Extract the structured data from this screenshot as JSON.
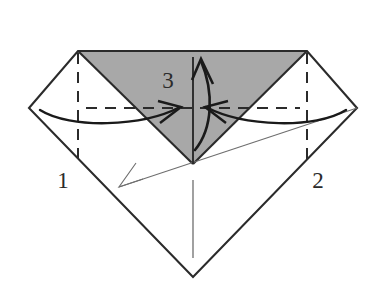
{
  "figure": {
    "kind": "origami-fold-diagram",
    "title": "",
    "background_color": "#ffffff",
    "width": 387,
    "height": 287
  },
  "colors": {
    "paper_front": "#ffffff",
    "paper_back_shaded": "#a8a8a8",
    "outline": "#2b2b2b",
    "fold_line": "#2b2b2b",
    "thin_crease": "#6e6e6e",
    "arrow": "#1a1a1a",
    "label_text": "#2b2b2b"
  },
  "shapes": {
    "kite_outline": {
      "name": "paper-outline",
      "points": "78,51 307,51 357,108 193,277 29,108"
    },
    "shaded_triangle": {
      "name": "shaded-flap",
      "points": "78,51 307,51 193,164",
      "fill": "#a8a8a8"
    }
  },
  "fold_lines": [
    {
      "name": "left-vertical-fold",
      "x1": 78,
      "y1": 53,
      "x2": 78,
      "y2": 166
    },
    {
      "name": "right-vertical-fold",
      "x1": 307,
      "y1": 53,
      "x2": 307,
      "y2": 166
    },
    {
      "name": "horizontal-fold",
      "x1": 86,
      "y1": 108,
      "x2": 300,
      "y2": 108
    }
  ],
  "crease_lines": [
    {
      "name": "diagonal-crease",
      "x1": 119,
      "y1": 187,
      "x2": 357,
      "y2": 108
    },
    {
      "name": "lower-center-crease",
      "x1": 193,
      "y1": 180,
      "x2": 193,
      "y2": 258
    },
    {
      "name": "center-vertical-crease",
      "x1": 193,
      "y1": 57,
      "x2": 193,
      "y2": 164
    }
  ],
  "arrows": [
    {
      "name": "fold-arrow-left",
      "direction": "right",
      "label_ref": "1",
      "path": "M 40,110 C 70,128 140,126 178,107",
      "head": "178,107 160,104 163,122"
    },
    {
      "name": "fold-arrow-right",
      "direction": "left",
      "label_ref": "2",
      "path": "M 345,110 C 315,128 248,126 210,107",
      "head": "210,107 228,104 225,122"
    },
    {
      "name": "fold-arrow-center",
      "direction": "up",
      "label_ref": "3",
      "path": "M 196,146 C 212,126 212,90 200,62",
      "head": "200,62 193,80 211,84"
    },
    {
      "name": "crease-arrow-head",
      "direction": "down-left",
      "head": "119,187 143,179 136,163"
    }
  ],
  "labels": [
    {
      "name": "step-number-1",
      "text": "1",
      "x": 63,
      "y": 188
    },
    {
      "name": "step-number-2",
      "text": "2",
      "x": 318,
      "y": 188
    },
    {
      "name": "step-number-3",
      "text": "3",
      "x": 168,
      "y": 88
    }
  ]
}
